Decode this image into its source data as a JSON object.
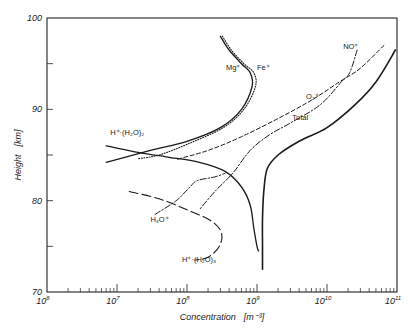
{
  "chart_data": {
    "type": "line",
    "title": "",
    "xlabel": "Concentration",
    "xlabel_unit": "[m⁻³]",
    "ylabel": "Height",
    "ylabel_unit": "[km]",
    "xscale": "log",
    "xlim": [
      1000000.0,
      100000000000.0
    ],
    "ylim": [
      70,
      100
    ],
    "x_tick_labels": [
      "10^6",
      "10^7",
      "10^8",
      "10^9",
      "10^10",
      "10^11"
    ],
    "y_tick_labels": [
      "70",
      "80",
      "90",
      "100"
    ],
    "grid": false,
    "legend": "inline labels",
    "series": [
      {
        "name": "Total",
        "style": "solid-thick",
        "points": [
          [
            95000000000.0,
            96.5
          ],
          [
            50000000000.0,
            93
          ],
          [
            25000000000.0,
            90.5
          ],
          [
            10000000000.0,
            88
          ],
          [
            4000000000.0,
            86.5
          ],
          [
            2000000000.0,
            85
          ],
          [
            1400000000.0,
            83.5
          ],
          [
            1250000000.0,
            81
          ],
          [
            1200000000.0,
            78
          ],
          [
            1200000000.0,
            75
          ],
          [
            1200000000.0,
            72.5
          ]
        ]
      },
      {
        "name": "NO+",
        "style": "dash-dot",
        "points": [
          [
            27000000000.0,
            96.5
          ],
          [
            21000000000.0,
            94
          ],
          [
            16000000000.0,
            93
          ],
          [
            8000000000.0,
            90.5
          ],
          [
            3000000000.0,
            88.5
          ],
          [
            1500000000.0,
            87.2
          ],
          [
            800000000.0,
            85.5
          ],
          [
            450000000.0,
            83
          ],
          [
            250000000.0,
            81
          ],
          [
            150000000.0,
            79
          ]
        ]
      },
      {
        "name": "O2+",
        "style": "dashed",
        "points": [
          [
            65000000000.0,
            97
          ],
          [
            30000000000.0,
            94.5
          ],
          [
            15000000000.0,
            93
          ],
          [
            6000000000.0,
            91
          ],
          [
            2000000000.0,
            89
          ],
          [
            600000000.0,
            87
          ],
          [
            200000000.0,
            85.5
          ],
          [
            70000000.0,
            84.5
          ]
        ]
      },
      {
        "name": "Mg+",
        "style": "solid",
        "points": [
          [
            300000000.0,
            98
          ],
          [
            400000000.0,
            96.5
          ],
          [
            600000000.0,
            95
          ],
          [
            800000000.0,
            94
          ],
          [
            850000000.0,
            92.5
          ],
          [
            600000000.0,
            90
          ],
          [
            300000000.0,
            88
          ],
          [
            100000000.0,
            86.5
          ],
          [
            30000000.0,
            85.5
          ],
          [
            7000000.0,
            84.2
          ]
        ]
      },
      {
        "name": "Fe+",
        "style": "dotted",
        "points": [
          [
            320000000.0,
            98
          ],
          [
            430000000.0,
            96.5
          ],
          [
            650000000.0,
            95
          ],
          [
            900000000.0,
            94
          ],
          [
            950000000.0,
            92.5
          ],
          [
            650000000.0,
            90
          ],
          [
            330000000.0,
            88
          ],
          [
            110000000.0,
            86.3
          ],
          [
            40000000.0,
            85
          ],
          [
            20000000.0,
            84.6
          ]
        ]
      },
      {
        "name": "H+(H2O)2",
        "style": "solid",
        "points": [
          [
            7000000.0,
            86
          ],
          [
            20000000.0,
            85.3
          ],
          [
            50000000.0,
            84.8
          ],
          [
            150000000.0,
            84.2
          ],
          [
            350000000.0,
            83.2
          ],
          [
            600000000.0,
            81.5
          ],
          [
            800000000.0,
            79.5
          ],
          [
            900000000.0,
            77
          ],
          [
            1000000000.0,
            75
          ],
          [
            1050000000.0,
            74.5
          ]
        ]
      },
      {
        "name": "H3O+",
        "style": "dash-dot",
        "points": [
          [
            35000000.0,
            78.5
          ],
          [
            70000000.0,
            80
          ],
          [
            110000000.0,
            81.5
          ],
          [
            140000000.0,
            82.2
          ],
          [
            250000000.0,
            82.6
          ],
          [
            350000000.0,
            83
          ]
        ]
      },
      {
        "name": "H+(H2O)3",
        "style": "long-dash",
        "points": [
          [
            15000000.0,
            81
          ],
          [
            40000000.0,
            80.2
          ],
          [
            100000000.0,
            79
          ],
          [
            220000000.0,
            77.8
          ],
          [
            310000000.0,
            76.5
          ],
          [
            290000000.0,
            75
          ],
          [
            200000000.0,
            73.8
          ],
          [
            130000000.0,
            73.5
          ]
        ]
      }
    ],
    "annotations": [
      {
        "text": "Mg⁺",
        "at": [
          360000000.0,
          94.3
        ]
      },
      {
        "text": "Fe⁺",
        "at": [
          1000000000.0,
          94.3
        ]
      },
      {
        "text": "NO⁺",
        "at": [
          17000000000.0,
          96.6
        ]
      },
      {
        "text": "O₂⁺",
        "at": [
          5000000000.0,
          91.1
        ]
      },
      {
        "text": "Total",
        "at": [
          3200000000.0,
          88.8
        ]
      },
      {
        "text": "H⁺·(H₂O)₂",
        "at": [
          8000000.0,
          87.2
        ]
      },
      {
        "text": "H₃O⁺",
        "at": [
          30000000.0,
          77.7
        ]
      },
      {
        "text": "H⁺·(H₂O)₃",
        "at": [
          85000000.0,
          73.3
        ]
      }
    ]
  }
}
